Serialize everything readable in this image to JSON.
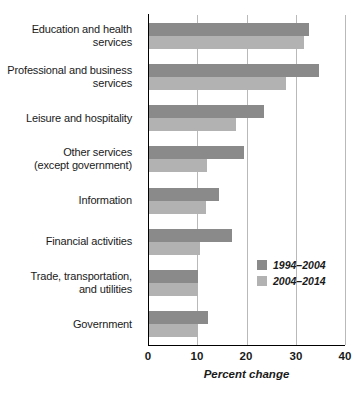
{
  "chart_data": {
    "type": "bar",
    "orientation": "horizontal",
    "title": "",
    "xlabel": "Percent change",
    "ylabel": "",
    "xlim": [
      0,
      40
    ],
    "xticks": [
      0,
      10,
      20,
      30,
      40
    ],
    "xtick_labels": [
      "0",
      "10",
      "20",
      "30",
      "40"
    ],
    "grid": "vertical",
    "legend_position": "inside-right",
    "categories": [
      "Education and health\nservices",
      "Professional and business\nservices",
      "Leisure and hospitality",
      "Other services\n(except government)",
      "Information",
      "Financial activities",
      "Trade, transportation,\nand utilities",
      "Government"
    ],
    "series": [
      {
        "name": "1994–2004",
        "color": "#8a8a8a",
        "values": [
          32.7,
          34.7,
          23.5,
          19.4,
          14.5,
          17.1,
          10.2,
          12.2
        ]
      },
      {
        "name": "2004–2014",
        "color": "#b2b2b2",
        "values": [
          31.6,
          28.1,
          17.8,
          12.0,
          11.8,
          10.6,
          10.2,
          10.2
        ]
      }
    ]
  },
  "axis": {
    "tick_0": "0",
    "tick_1": "10",
    "tick_2": "20",
    "tick_3": "30",
    "tick_4": "40",
    "x_title": "Percent change"
  },
  "legend": {
    "items": [
      {
        "label": "1994–2004",
        "color": "#8a8a8a"
      },
      {
        "label": "2004–2014",
        "color": "#b2b2b2"
      }
    ]
  },
  "labels": {
    "cat_0": "Education and health\nservices",
    "cat_1": "Professional and business\nservices",
    "cat_2": "Leisure and hospitality",
    "cat_3": "Other services\n(except government)",
    "cat_4": "Information",
    "cat_5": "Financial activities",
    "cat_6": "Trade, transportation,\nand utilities",
    "cat_7": "Government"
  },
  "colors": {
    "series_1": "#8a8a8a",
    "series_2": "#b2b2b2",
    "axis": "#000000",
    "grid": "#b9b9b9",
    "text": "#1a1a1a",
    "background": "#ffffff"
  }
}
